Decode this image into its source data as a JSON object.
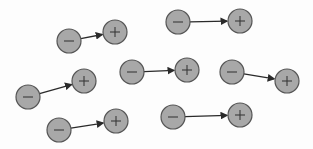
{
  "diagram": {
    "colors": {
      "charge_fill": "#a8a8a8",
      "charge_stroke": "#555555",
      "arrow": "#2a2a2a",
      "background": "#fdfdfd"
    },
    "radius": 12,
    "dipoles": [
      {
        "neg": [
          69,
          41
        ],
        "pos": [
          115,
          32
        ]
      },
      {
        "neg": [
          178,
          22
        ],
        "pos": [
          240,
          21
        ]
      },
      {
        "neg": [
          132,
          72
        ],
        "pos": [
          187,
          70
        ]
      },
      {
        "neg": [
          232,
          72
        ],
        "pos": [
          287,
          81
        ]
      },
      {
        "neg": [
          28,
          97
        ],
        "pos": [
          84,
          81
        ]
      },
      {
        "neg": [
          59,
          130
        ],
        "pos": [
          116,
          121
        ]
      },
      {
        "neg": [
          173,
          117
        ],
        "pos": [
          240,
          115
        ]
      }
    ],
    "labels": {
      "negative": "−",
      "positive": "+"
    }
  }
}
